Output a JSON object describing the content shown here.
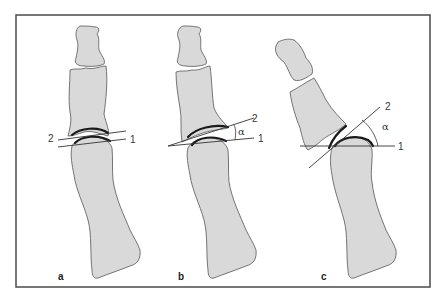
{
  "figure": {
    "background": "#ffffff",
    "frame_color": "#555555",
    "bone_fill": "#d9d9d9",
    "panels": [
      {
        "id": "a",
        "label": "a",
        "line_labels": {
          "line1": "1",
          "line2": "2"
        },
        "description": "Neutral alignment: lines 1 and 2 parallel"
      },
      {
        "id": "b",
        "label": "b",
        "line_labels": {
          "line1": "1",
          "line2": "2"
        },
        "angle_label": "α",
        "description": "Moderate angulation α between lines 1 and 2"
      },
      {
        "id": "c",
        "label": "c",
        "line_labels": {
          "line1": "1",
          "line2": "2"
        },
        "angle_label": "α",
        "description": "Large angulation α between lines 1 and 2"
      }
    ]
  }
}
